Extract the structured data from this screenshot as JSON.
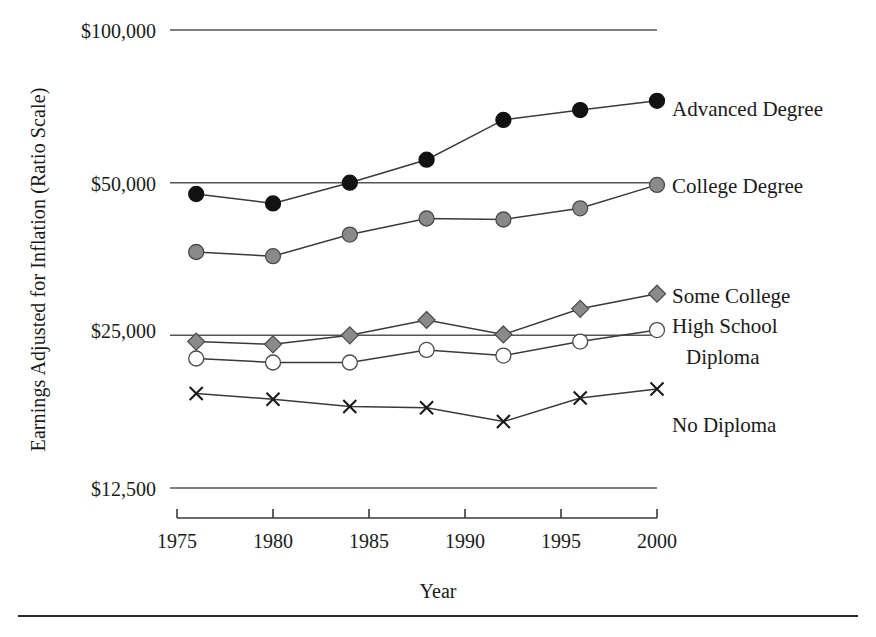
{
  "axes": {
    "ylabel": "Earnings Adjusted for Inflation (Ratio Scale)",
    "xlabel": "Year",
    "yticks": [
      "$100,000",
      "$50,000",
      "$25,000",
      "$12,500"
    ],
    "xticks": [
      "1975",
      "1980",
      "1985",
      "1990",
      "1995",
      "2000"
    ]
  },
  "labels": {
    "advanced": "Advanced Degree",
    "college": "College Degree",
    "some_college": "Some College",
    "high_school_1": "High School",
    "high_school_2": "Diploma",
    "no_diploma": "No Diploma"
  },
  "colors": {
    "ink": "#1a1a1a",
    "line": "#3a3a3a",
    "black_marker": "#121212",
    "gray_marker": "#8a8a8a",
    "open_marker": "#ffffff",
    "gridline": "#555555"
  },
  "chart_data": {
    "type": "line",
    "title": "",
    "xlabel": "Year",
    "ylabel": "Earnings Adjusted for Inflation (Ratio Scale)",
    "yscale": "log",
    "ylim": [
      12500,
      100000
    ],
    "xlim": [
      1975,
      2000
    ],
    "ytick_values": [
      100000,
      50000,
      25000,
      12500
    ],
    "ytick_labels": [
      "$100,000",
      "$50,000",
      "$25,000",
      "$12,500"
    ],
    "xtick_values": [
      1975,
      1980,
      1985,
      1990,
      1995,
      2000
    ],
    "grid": "horizontal",
    "legend": "inline-right-of-last-point",
    "x": [
      1976,
      1980,
      1984,
      1988,
      1992,
      1996,
      2000
    ],
    "series": [
      {
        "name": "Advanced Degree",
        "marker": "filled-circle",
        "color": "#121212",
        "values": [
          47500,
          45500,
          50000,
          55500,
          66500,
          69500,
          72500
        ]
      },
      {
        "name": "College Degree",
        "marker": "gray-circle",
        "color": "#8a8a8a",
        "values": [
          36500,
          35800,
          39500,
          42500,
          42300,
          44500,
          49500
        ]
      },
      {
        "name": "Some College",
        "marker": "gray-diamond",
        "color": "#8a8a8a",
        "values": [
          24300,
          24000,
          25000,
          26800,
          25100,
          28200,
          30200
        ]
      },
      {
        "name": "High School Diploma",
        "marker": "open-circle",
        "color": "#ffffff",
        "values": [
          22500,
          22100,
          22100,
          23400,
          22800,
          24300,
          25600
        ]
      },
      {
        "name": "No Diploma",
        "marker": "x",
        "color": "#1a1a1a",
        "values": [
          19200,
          18700,
          18100,
          18000,
          16900,
          18800,
          19600
        ]
      }
    ]
  }
}
